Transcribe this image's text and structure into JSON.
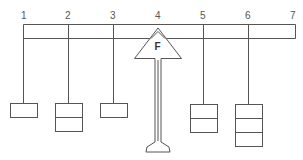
{
  "diagram": {
    "type": "lever-balance",
    "beam": {
      "x1": 23,
      "x2": 295,
      "y_top": 24,
      "y_bottom": 38
    },
    "positions": [
      {
        "label": "1",
        "x": 23,
        "weights": 1
      },
      {
        "label": "2",
        "x": 68,
        "weights": 2
      },
      {
        "label": "3",
        "x": 113,
        "weights": 1
      },
      {
        "label": "4",
        "x": 158,
        "weights": 0,
        "fulcrum": true
      },
      {
        "label": "5",
        "x": 203,
        "weights": 2
      },
      {
        "label": "6",
        "x": 248,
        "weights": 3
      },
      {
        "label": "7",
        "x": 293,
        "weights": 0
      }
    ],
    "fulcrum": {
      "label": "F",
      "x": 158
    },
    "colors": {
      "line": "#555555",
      "background": "#ffffff"
    }
  }
}
